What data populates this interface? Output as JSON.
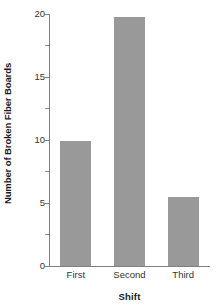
{
  "chart_data": {
    "type": "bar",
    "title": "",
    "subtitle": "",
    "categories": [
      "First",
      "Second",
      "Third"
    ],
    "values": [
      9.9,
      19.8,
      5.5
    ],
    "xlabel": "Shift",
    "ylabel": "Number of Broken Fiber Boards",
    "ylim": [
      0,
      20
    ],
    "yticks": [
      0,
      5,
      10,
      15,
      20
    ],
    "ytick_labels": [
      "0",
      "5",
      "10",
      "15",
      "20"
    ],
    "yminor_ticks": [
      2.5,
      7.5,
      12.5,
      17.5
    ],
    "grid": false,
    "legend": null,
    "bar_color": "#999999",
    "axis_color": "#808080",
    "background": "#ffffff",
    "annotations": []
  },
  "axes": {
    "y_title": "Number of Broken Fiber Boards",
    "x_title": "Shift"
  },
  "ticks": {
    "y": [
      {
        "label": "20",
        "value": 20
      },
      {
        "label": "15",
        "value": 15
      },
      {
        "label": "10",
        "value": 10
      },
      {
        "label": "5",
        "value": 5
      },
      {
        "label": "0",
        "value": 0
      }
    ],
    "x": [
      {
        "label": "First"
      },
      {
        "label": "Second"
      },
      {
        "label": "Third"
      }
    ]
  }
}
